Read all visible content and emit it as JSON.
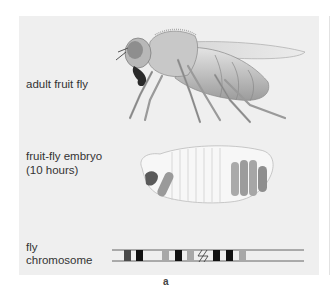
{
  "figure": {
    "labels": {
      "adult": "adult fruit fly",
      "embryo_line1": "fruit-fly embryo",
      "embryo_line2": "(10 hours)",
      "chromosome_line1": "fly",
      "chromosome_line2": "chromosome"
    },
    "panel_letter": "a",
    "colors": {
      "panel_bg": "#efefef",
      "band_dark": "#111111",
      "band_mid": "#4a4a4a",
      "band_light": "#a8a8a8",
      "embryo_body": "#f7f7f7",
      "embryo_segment": "#9a9a9a"
    }
  }
}
